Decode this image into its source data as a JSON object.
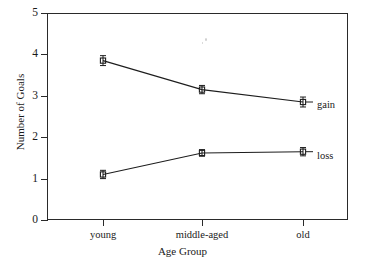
{
  "chart_data": {
    "type": "line",
    "title": "",
    "xlabel": "Age Group",
    "ylabel": "Number of Goals",
    "categories": [
      "young",
      "middle-aged",
      "old"
    ],
    "ylim": [
      0,
      5
    ],
    "yticks": [
      "0",
      "1",
      "2",
      "3",
      "4",
      "5"
    ],
    "grid": false,
    "legend_position": "right-inline",
    "error_bars": true,
    "series": [
      {
        "name": "gain",
        "values": [
          3.85,
          3.15,
          2.85
        ],
        "errors": [
          0.12,
          0.1,
          0.12
        ],
        "marker": "open-square"
      },
      {
        "name": "loss",
        "values": [
          1.1,
          1.62,
          1.65
        ],
        "errors": [
          0.1,
          0.08,
          0.1
        ],
        "marker": "open-square"
      }
    ]
  },
  "axes": {
    "y_title": "Number of Goals",
    "x_title": "Age Group",
    "y_tick_labels": [
      "5",
      "4",
      "3",
      "2",
      "1",
      "0"
    ],
    "x_tick_labels": [
      "young",
      "middle-aged",
      "old"
    ]
  },
  "annotations": {
    "gain_label": "gain",
    "loss_label": "loss"
  },
  "colors": {
    "line": "#1d1d1d",
    "marker_fill": "#ffffff",
    "axis": "#2a2a2a",
    "background": "#ffffff"
  }
}
